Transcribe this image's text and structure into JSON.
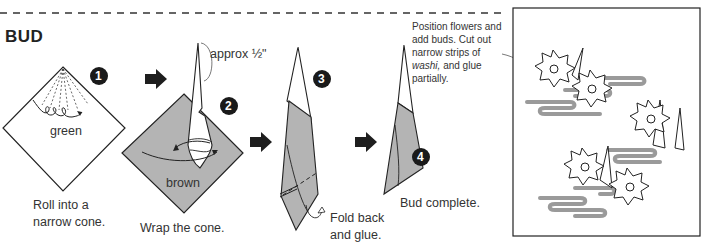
{
  "section": {
    "title": "BUD"
  },
  "steps": [
    {
      "number": "1",
      "paper_label": "green",
      "caption_lines": [
        "Roll into a",
        "narrow cone."
      ]
    },
    {
      "number": "2",
      "paper_label": "brown",
      "caption_lines": [
        "Wrap the cone."
      ],
      "measure": "approx ½\""
    },
    {
      "number": "3",
      "caption_lines": [
        "Fold back",
        "and glue."
      ]
    },
    {
      "number": "4",
      "caption_lines": [
        "Bud complete."
      ]
    }
  ],
  "final_note": {
    "lines": [
      "Position flowers and",
      "add buds. Cut out",
      "narrow strips of",
      "and glue",
      "partially."
    ],
    "italic_word": "washi,"
  },
  "colors": {
    "paper_gray": "#b4b4b4",
    "strip_gray": "#9a9a9a",
    "line": "#222222"
  }
}
